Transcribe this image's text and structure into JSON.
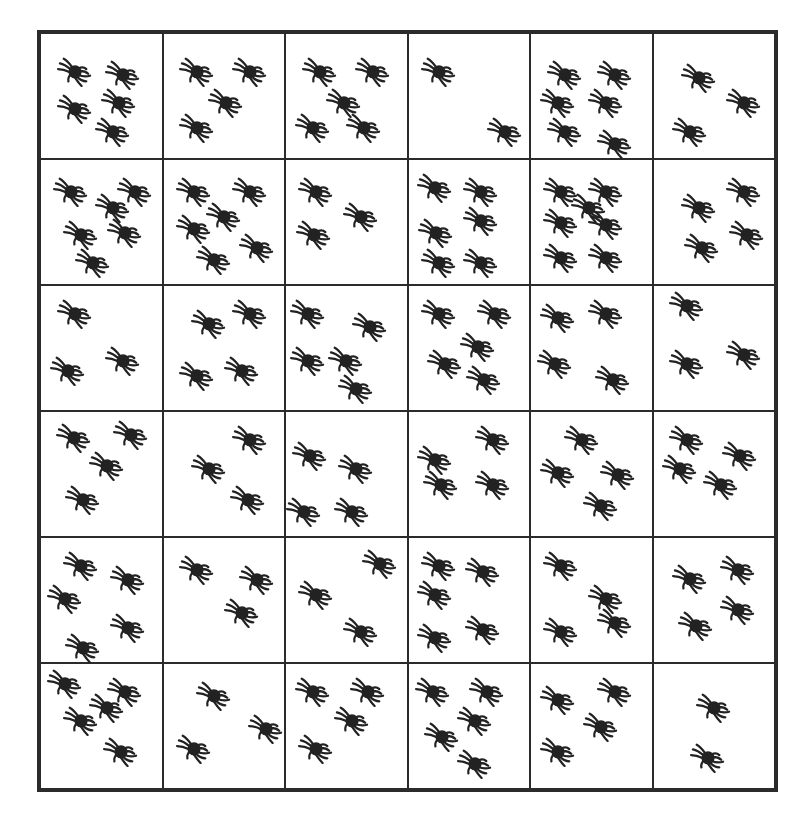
{
  "worksheet": {
    "grid": {
      "rows": 6,
      "columns": 6,
      "icon": "spider-icon",
      "border_color": "#2b2b2b",
      "spider_color": "#222222"
    },
    "cells": [
      {
        "row": 0,
        "col": 0,
        "count": 5,
        "spiders": [
          [
            28,
            30
          ],
          [
            68,
            32
          ],
          [
            65,
            55
          ],
          [
            28,
            60
          ],
          [
            60,
            78
          ]
        ]
      },
      {
        "row": 0,
        "col": 1,
        "count": 4,
        "spiders": [
          [
            28,
            30
          ],
          [
            72,
            30
          ],
          [
            52,
            55
          ],
          [
            28,
            75
          ]
        ]
      },
      {
        "row": 0,
        "col": 2,
        "count": 5,
        "spiders": [
          [
            28,
            30
          ],
          [
            72,
            30
          ],
          [
            48,
            55
          ],
          [
            22,
            75
          ],
          [
            65,
            75
          ]
        ]
      },
      {
        "row": 0,
        "col": 3,
        "count": 2,
        "spiders": [
          [
            25,
            30
          ],
          [
            80,
            78
          ]
        ]
      },
      {
        "row": 0,
        "col": 4,
        "count": 6,
        "spiders": [
          [
            28,
            32
          ],
          [
            70,
            32
          ],
          [
            22,
            55
          ],
          [
            62,
            55
          ],
          [
            28,
            78
          ],
          [
            70,
            88
          ]
        ]
      },
      {
        "row": 0,
        "col": 5,
        "count": 3,
        "spiders": [
          [
            38,
            35
          ],
          [
            75,
            55
          ],
          [
            30,
            78
          ]
        ]
      },
      {
        "row": 1,
        "col": 0,
        "count": 6,
        "spiders": [
          [
            25,
            25
          ],
          [
            60,
            38
          ],
          [
            78,
            25
          ],
          [
            33,
            60
          ],
          [
            70,
            58
          ],
          [
            43,
            82
          ]
        ]
      },
      {
        "row": 1,
        "col": 1,
        "count": 6,
        "spiders": [
          [
            25,
            25
          ],
          [
            72,
            25
          ],
          [
            50,
            45
          ],
          [
            25,
            55
          ],
          [
            78,
            70
          ],
          [
            42,
            80
          ]
        ]
      },
      {
        "row": 1,
        "col": 2,
        "count": 3,
        "spiders": [
          [
            25,
            25
          ],
          [
            62,
            45
          ],
          [
            23,
            60
          ]
        ]
      },
      {
        "row": 1,
        "col": 3,
        "count": 6,
        "spiders": [
          [
            22,
            22
          ],
          [
            60,
            25
          ],
          [
            60,
            48
          ],
          [
            23,
            58
          ],
          [
            25,
            82
          ],
          [
            60,
            82
          ]
        ]
      },
      {
        "row": 1,
        "col": 4,
        "count": 7,
        "spiders": [
          [
            25,
            25
          ],
          [
            62,
            25
          ],
          [
            48,
            38
          ],
          [
            25,
            50
          ],
          [
            62,
            52
          ],
          [
            25,
            78
          ],
          [
            62,
            78
          ]
        ]
      },
      {
        "row": 1,
        "col": 5,
        "count": 4,
        "spiders": [
          [
            38,
            38
          ],
          [
            75,
            25
          ],
          [
            40,
            70
          ],
          [
            78,
            60
          ]
        ]
      },
      {
        "row": 2,
        "col": 0,
        "count": 3,
        "spiders": [
          [
            28,
            22
          ],
          [
            68,
            60
          ],
          [
            22,
            68
          ]
        ]
      },
      {
        "row": 2,
        "col": 1,
        "count": 4,
        "spiders": [
          [
            38,
            30
          ],
          [
            72,
            22
          ],
          [
            28,
            72
          ],
          [
            65,
            68
          ]
        ]
      },
      {
        "row": 2,
        "col": 2,
        "count": 5,
        "spiders": [
          [
            18,
            22
          ],
          [
            70,
            32
          ],
          [
            18,
            60
          ],
          [
            50,
            60
          ],
          [
            58,
            82
          ]
        ]
      },
      {
        "row": 2,
        "col": 3,
        "count": 5,
        "spiders": [
          [
            25,
            22
          ],
          [
            72,
            22
          ],
          [
            58,
            48
          ],
          [
            30,
            62
          ],
          [
            63,
            75
          ]
        ]
      },
      {
        "row": 2,
        "col": 4,
        "count": 4,
        "spiders": [
          [
            22,
            25
          ],
          [
            62,
            22
          ],
          [
            20,
            62
          ],
          [
            68,
            75
          ]
        ]
      },
      {
        "row": 2,
        "col": 5,
        "count": 3,
        "spiders": [
          [
            28,
            15
          ],
          [
            75,
            55
          ],
          [
            28,
            62
          ]
        ]
      },
      {
        "row": 3,
        "col": 0,
        "count": 4,
        "spiders": [
          [
            27,
            20
          ],
          [
            75,
            18
          ],
          [
            55,
            43
          ],
          [
            35,
            70
          ]
        ]
      },
      {
        "row": 3,
        "col": 1,
        "count": 3,
        "spiders": [
          [
            38,
            45
          ],
          [
            72,
            22
          ],
          [
            70,
            70
          ]
        ]
      },
      {
        "row": 3,
        "col": 2,
        "count": 4,
        "spiders": [
          [
            20,
            35
          ],
          [
            58,
            45
          ],
          [
            15,
            80
          ],
          [
            55,
            80
          ]
        ]
      },
      {
        "row": 3,
        "col": 3,
        "count": 4,
        "spiders": [
          [
            22,
            38
          ],
          [
            70,
            22
          ],
          [
            27,
            58
          ],
          [
            70,
            58
          ]
        ]
      },
      {
        "row": 3,
        "col": 4,
        "count": 4,
        "spiders": [
          [
            42,
            22
          ],
          [
            22,
            48
          ],
          [
            72,
            50
          ],
          [
            58,
            75
          ]
        ]
      },
      {
        "row": 3,
        "col": 5,
        "count": 4,
        "spiders": [
          [
            28,
            22
          ],
          [
            72,
            35
          ],
          [
            22,
            45
          ],
          [
            56,
            58
          ]
        ]
      },
      {
        "row": 4,
        "col": 0,
        "count": 5,
        "spiders": [
          [
            33,
            22
          ],
          [
            72,
            33
          ],
          [
            20,
            48
          ],
          [
            72,
            72
          ],
          [
            35,
            88
          ]
        ]
      },
      {
        "row": 4,
        "col": 1,
        "count": 3,
        "spiders": [
          [
            28,
            25
          ],
          [
            78,
            33
          ],
          [
            65,
            60
          ]
        ]
      },
      {
        "row": 4,
        "col": 2,
        "count": 3,
        "spiders": [
          [
            25,
            45
          ],
          [
            78,
            20
          ],
          [
            62,
            75
          ]
        ]
      },
      {
        "row": 4,
        "col": 3,
        "count": 5,
        "spiders": [
          [
            25,
            22
          ],
          [
            62,
            27
          ],
          [
            22,
            45
          ],
          [
            62,
            73
          ],
          [
            22,
            80
          ]
        ]
      },
      {
        "row": 4,
        "col": 4,
        "count": 4,
        "spiders": [
          [
            25,
            22
          ],
          [
            62,
            48
          ],
          [
            25,
            75
          ],
          [
            70,
            68
          ]
        ]
      },
      {
        "row": 4,
        "col": 5,
        "count": 4,
        "spiders": [
          [
            30,
            32
          ],
          [
            70,
            25
          ],
          [
            35,
            70
          ],
          [
            70,
            57
          ]
        ]
      },
      {
        "row": 5,
        "col": 0,
        "count": 5,
        "spiders": [
          [
            20,
            15
          ],
          [
            70,
            22
          ],
          [
            55,
            35
          ],
          [
            33,
            45
          ],
          [
            66,
            70
          ]
        ]
      },
      {
        "row": 5,
        "col": 1,
        "count": 3,
        "spiders": [
          [
            42,
            25
          ],
          [
            85,
            52
          ],
          [
            25,
            68
          ]
        ]
      },
      {
        "row": 5,
        "col": 2,
        "count": 4,
        "spiders": [
          [
            22,
            22
          ],
          [
            68,
            22
          ],
          [
            55,
            45
          ],
          [
            25,
            68
          ]
        ]
      },
      {
        "row": 5,
        "col": 3,
        "count": 5,
        "spiders": [
          [
            20,
            22
          ],
          [
            65,
            22
          ],
          [
            55,
            45
          ],
          [
            28,
            58
          ],
          [
            55,
            80
          ]
        ]
      },
      {
        "row": 5,
        "col": 4,
        "count": 4,
        "spiders": [
          [
            22,
            28
          ],
          [
            70,
            22
          ],
          [
            58,
            50
          ],
          [
            22,
            70
          ]
        ]
      },
      {
        "row": 5,
        "col": 5,
        "count": 2,
        "spiders": [
          [
            50,
            35
          ],
          [
            45,
            75
          ]
        ]
      }
    ]
  }
}
